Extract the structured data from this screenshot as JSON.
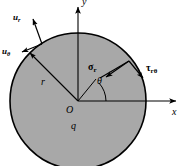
{
  "figure": {
    "type": "polar-coordinate-disk-diagram",
    "background_color": "#ffffff",
    "disk": {
      "fill_color": "#a8a8a8",
      "stroke_color": "#000000",
      "center_x": 78,
      "center_y": 101,
      "radius": 68
    },
    "axes": {
      "x_label": "x",
      "y_label": "y",
      "origin_label": "O",
      "axis_color": "#000000"
    },
    "labels": {
      "displacement_radial": "u",
      "displacement_radial_sub": "r",
      "displacement_tangential": "u",
      "displacement_tangential_sub": "θ",
      "normal_stress": "σ",
      "normal_stress_sub": "r",
      "shear_stress": "τ",
      "shear_stress_sub": "rθ",
      "radius": "r",
      "angle": "θ",
      "load": "q"
    }
  }
}
